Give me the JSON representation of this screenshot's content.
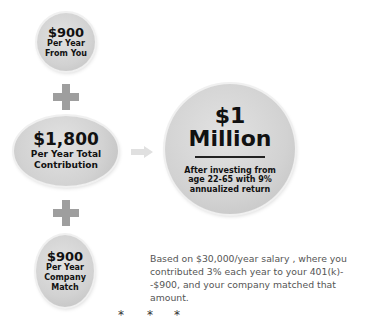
{
  "you": {
    "amount": "$900",
    "line1": "Per Year",
    "line2": "From You"
  },
  "total": {
    "amount": "$1,800",
    "line1": "Per Year Total",
    "line2": "Contribution"
  },
  "company": {
    "amount": "$900",
    "line1": "Per Year",
    "line2": "Company",
    "line3": "Match"
  },
  "result": {
    "line1": "$1",
    "line2": "Million",
    "desc1": "After investing from",
    "desc2": "age 22-65 with 9%",
    "desc3": "annualized return"
  },
  "note": "Based on $30,000/year salary , where you contributed 3% each year to your 401(k)--$900, and your company matched that amount.",
  "stars": [
    "*",
    "*",
    "*"
  ],
  "icons": {
    "plus": "plus-icon",
    "arrow": "arrow-right-icon"
  }
}
